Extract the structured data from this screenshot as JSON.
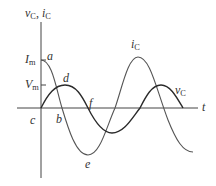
{
  "axes": {
    "y_label_main": "v",
    "y_label_sub1": "C",
    "y_label_sep": ", ",
    "y_label_main2": "i",
    "y_label_sub2": "C",
    "x_label": "t"
  },
  "ticks": {
    "im_main": "I",
    "im_sub": "m",
    "vm_main": "V",
    "vm_sub": "m"
  },
  "curves": {
    "ic_main": "i",
    "ic_sub": "C",
    "vc_main": "v",
    "vc_sub": "C"
  },
  "points": {
    "a": "a",
    "b": "b",
    "c": "c",
    "d": "d",
    "e": "e",
    "f": "f"
  },
  "colors": {
    "axis": "#444444",
    "ic_curve": "#555555",
    "vc_curve": "#2a2a2a"
  }
}
